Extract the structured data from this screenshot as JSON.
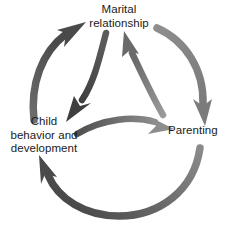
{
  "diagram": {
    "type": "cycle-diagram",
    "background_color": "#ffffff",
    "text_color": "#1a1a1a",
    "nodes": [
      {
        "id": "marital",
        "label": "Marital\nrelationship",
        "position": "top"
      },
      {
        "id": "parenting",
        "label": "Parenting",
        "position": "right"
      },
      {
        "id": "child",
        "label": "Child\nbehavior and\ndevelopment",
        "position": "bottom-left"
      }
    ],
    "arrows": [
      {
        "id": "outer-child-to-marital",
        "from": "child",
        "to": "marital",
        "ring": "outer",
        "direction": "clockwise",
        "color_start": "#6d6d6d",
        "color_end": "#4a4a4a"
      },
      {
        "id": "outer-marital-to-parenting",
        "from": "marital",
        "to": "parenting",
        "ring": "outer",
        "direction": "clockwise",
        "color_start": "#8e8e8e",
        "color_end": "#7b7b7b"
      },
      {
        "id": "outer-parenting-to-child",
        "from": "parenting",
        "to": "child",
        "ring": "outer",
        "direction": "clockwise",
        "color_start": "#8a8a8a",
        "color_end": "#4a4a4a"
      },
      {
        "id": "inner-marital-to-child",
        "from": "marital",
        "to": "child",
        "ring": "inner",
        "direction": "counter-clockwise",
        "color_start": "#5a5a5a",
        "color_end": "#3f3f3f"
      },
      {
        "id": "inner-child-to-parenting",
        "from": "child",
        "to": "parenting",
        "ring": "inner",
        "direction": "counter-clockwise",
        "color_start": "#4f4f4f",
        "color_end": "#8d8d8d"
      },
      {
        "id": "inner-parenting-to-marital",
        "from": "parenting",
        "to": "marital",
        "ring": "inner",
        "direction": "counter-clockwise",
        "color_start": "#9a9a9a",
        "color_end": "#6a6a6a"
      }
    ]
  }
}
